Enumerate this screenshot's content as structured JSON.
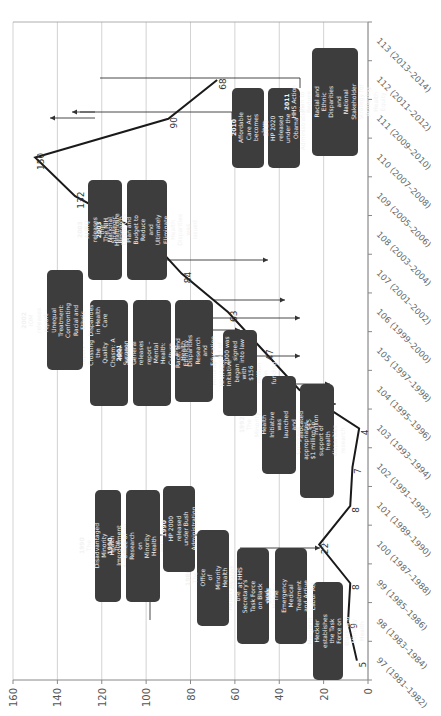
{
  "chart_data": {
    "type": "line",
    "orientation": "rotated-90-clockwise",
    "title": "",
    "xlabel": "Congress (years)",
    "ylabel": "",
    "ylim": [
      0,
      160
    ],
    "yticks": [
      0,
      20,
      40,
      60,
      80,
      100,
      120,
      140,
      160
    ],
    "grid": true,
    "categories": [
      "97 (1981–1982)",
      "98 (1983–1984)",
      "99 (1985–1986)",
      "100 (1987–1988)",
      "101 (1989–1990)",
      "102 (1991–1992)",
      "103 (1993–1994)",
      "104 (1995–1996)",
      "105 (1997–1998)",
      "106 (1999–2000)",
      "107 (2001–2002)",
      "108 (2003–2004)",
      "109 (2005–2006)",
      "110 (2007–2008)",
      "111 (2009–2010)",
      "112 (2011–2012)",
      "113 (2013–2014)"
    ],
    "values": [
      5,
      9,
      8,
      22,
      8,
      7,
      4,
      31,
      47,
      63,
      84,
      100,
      132,
      150,
      90,
      68,
      null
    ],
    "value_labels": [
      "5",
      "9",
      "8",
      "22",
      "8",
      "7",
      "4",
      "31",
      "47",
      "63",
      "84",
      "",
      "132",
      "150",
      "90",
      "68",
      ""
    ],
    "annotations": [
      {
        "year": "1984",
        "text": "HHS Sec. Margaret Heckler establishes the Task Force on Black and Minority Health"
      },
      {
        "year": "1985",
        "text": "Report of the Secretary's Task Force on Black and Minority Health"
      },
      {
        "year": "1985",
        "text": "The Emergency Medical Treatment and Active Labor Act"
      },
      {
        "year": "1986",
        "text": "The Office of Minority Health created at HHS"
      },
      {
        "year": "1990",
        "text": "The Disadvantaged Minority Health Improvement Act signed into law"
      },
      {
        "year": "1990",
        "text": "The Office of Research on Minority Health was created at NIH"
      },
      {
        "year": "1990",
        "text": "HP 2000 released under Bush Administration"
      },
      {
        "year": "1991",
        "text": "Congress appropriates $1 million to support of health disparities research"
      },
      {
        "year": "1992",
        "text": "The Minority Health Initiative was launched and allocated $45 million"
      },
      {
        "year": "1998",
        "text": "Minority HIV/AIDS Initiative began with $156 million in funding"
      },
      {
        "year": "2000",
        "text": "The Minority Health and Health Disparities Research and Education Act of 2000 was signed into law"
      },
      {
        "year": "2001",
        "text": "IOM releases report – Crossing the Quality Chasm: A New Health System for the 21st Century"
      },
      {
        "year": "2001",
        "text": "Surgeon General releases report – Mental Health: Culture, Race, and Ethnicity"
      },
      {
        "year": "2002",
        "text": "IOM releases report – Unequal Treatment: Confronting Racial and Ethnic Disparities in Health Care"
      },
      {
        "year": "2003",
        "text": "AHRQ releases the National Healthcare Disparities Report"
      },
      {
        "year": "2003",
        "text": "The NIH Strategic Research Plan and Budget to Reduce and Ultimately Eliminate Health Disparities was issued"
      },
      {
        "year": "2010",
        "text": "Affordable Care Act becomes law"
      },
      {
        "year": "2010",
        "text": "HP 2020 released under the Obama Administration"
      },
      {
        "year": "2011",
        "text": "HHS Action Plan to Reduce Racial and Ethnic Disparities and National Stakeholder Strategy for Achieving Health Equity"
      }
    ]
  },
  "colors": {
    "line": "#1a1a1a",
    "box_bg": "#3d3d3d",
    "box_text": "#f2f2f2",
    "grid": "#c8c8c8",
    "axis": "#888888"
  }
}
